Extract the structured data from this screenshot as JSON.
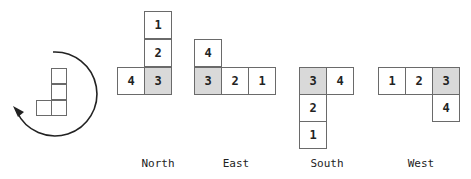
{
  "diagram": {
    "rotation_icon": "clockwise-arrow-icon",
    "orientations": [
      {
        "name": "North",
        "cells": [
          {
            "label": "1",
            "shaded": false,
            "x": 144,
            "y": 11
          },
          {
            "label": "2",
            "shaded": false,
            "x": 144,
            "y": 39
          },
          {
            "label": "3",
            "shaded": true,
            "x": 144,
            "y": 67
          },
          {
            "label": "4",
            "shaded": false,
            "x": 116,
            "y": 67
          }
        ],
        "label_x": 158
      },
      {
        "name": "East",
        "cells": [
          {
            "label": "4",
            "shaded": false,
            "x": 194,
            "y": 39
          },
          {
            "label": "3",
            "shaded": true,
            "x": 194,
            "y": 67
          },
          {
            "label": "2",
            "shaded": false,
            "x": 222,
            "y": 67
          },
          {
            "label": "1",
            "shaded": false,
            "x": 250,
            "y": 67
          }
        ],
        "label_x": 236
      },
      {
        "name": "South",
        "cells": [
          {
            "label": "3",
            "shaded": true,
            "x": 299,
            "y": 67
          },
          {
            "label": "4",
            "shaded": false,
            "x": 327,
            "y": 67
          },
          {
            "label": "2",
            "shaded": false,
            "x": 299,
            "y": 95
          },
          {
            "label": "1",
            "shaded": false,
            "x": 299,
            "y": 123
          }
        ],
        "label_x": 327
      },
      {
        "name": "West",
        "cells": [
          {
            "label": "1",
            "shaded": false,
            "x": 377,
            "y": 67
          },
          {
            "label": "2",
            "shaded": false,
            "x": 405,
            "y": 67
          },
          {
            "label": "3",
            "shaded": true,
            "x": 433,
            "y": 67
          },
          {
            "label": "4",
            "shaded": false,
            "x": 433,
            "y": 95
          }
        ],
        "label_x": 419
      }
    ],
    "colors": {
      "shaded": "#d9d9d9",
      "border": "#6a6a6a",
      "text": "#222222"
    }
  }
}
